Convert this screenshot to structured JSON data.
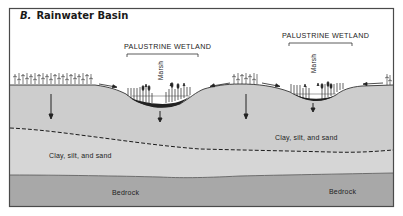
{
  "figure": {
    "panel_letter": "B.",
    "title": "Rainwater Basin"
  },
  "wetlands": [
    {
      "label": "PALUSTRINE WETLAND",
      "zone_label": "Marsh"
    },
    {
      "label": "PALUSTRINE WETLAND",
      "zone_label": "Marsh"
    }
  ],
  "layers": {
    "upper_sediment": "Clay, silt, and sand",
    "lower_sediment": "Clay, silt, and sand",
    "bedrock_left": "Bedrock",
    "bedrock_right": "Bedrock"
  },
  "colors": {
    "background": "#ffffff",
    "frame": "#4a4a4a",
    "upper_layer": "#cfcfcf",
    "lower_layer": "#d8d8d8",
    "bedrock": "#a9a9a9",
    "ink": "#1a1a1a"
  }
}
